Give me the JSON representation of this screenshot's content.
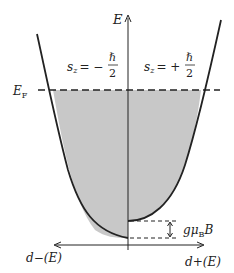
{
  "diagram": {
    "axes": {
      "energy_label": "E",
      "left_label": "d−(E)",
      "right_label": "d+(E)"
    },
    "fermi_label": "E",
    "fermi_sub": "F",
    "spin_down": {
      "lhs": "s",
      "sub": "z",
      "sign": "= −",
      "num": "ℏ",
      "den": "2"
    },
    "spin_up": {
      "lhs": "s",
      "sub": "z",
      "sign": "= +",
      "num": "ℏ",
      "den": "2"
    },
    "zeeman": {
      "g": "gμ",
      "sub": "B",
      "B": "B"
    },
    "colors": {
      "fill": "#c8c8c8",
      "line": "#222222"
    }
  }
}
